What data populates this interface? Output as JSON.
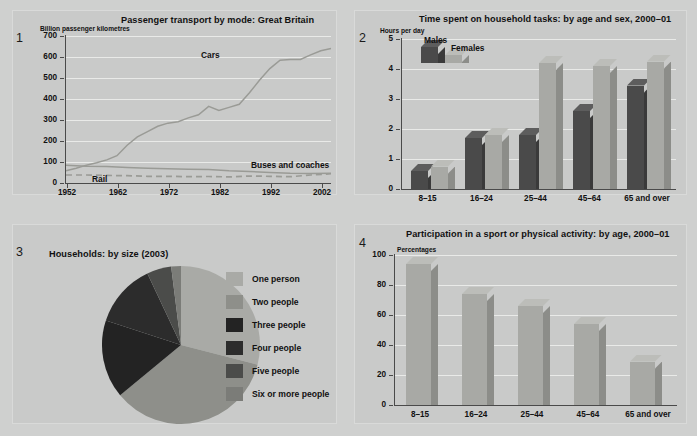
{
  "page": {
    "background": "#cfd0cf",
    "panel_bg": "#c9cac9"
  },
  "colors": {
    "dark_bar": "#4a4a4a",
    "dark_bar_side": "#3a3a3a",
    "light_bar": "#a8a9a5",
    "light_bar_side": "#8c8d89",
    "line_color": "#9a9b96",
    "grid": "#e9eae8",
    "axis": "#4a4a4a",
    "pie_one_person": "#a9aaa6",
    "pie_two_people": "#8e8f8a",
    "pie_three_people": "#232323",
    "pie_four_people": "#2c2c2c",
    "pie_five_people": "#4b4c4a",
    "pie_six_or_more": "#7b7c78"
  },
  "panels": [
    {
      "number": "1",
      "title": "Passenger transport by mode: Great Britain",
      "chart_data": {
        "type": "line",
        "title": "Passenger transport by mode: Great Britain",
        "ylabel": "Billion passenger kilometres",
        "xlabel": "",
        "ylim": [
          0,
          700
        ],
        "yticks": [
          0,
          100,
          200,
          300,
          400,
          500,
          600,
          700
        ],
        "xlim": [
          1952,
          2004
        ],
        "xticks": [
          1952,
          1962,
          1972,
          1982,
          1992,
          2002
        ],
        "grid": true,
        "legend_position": "inline-annotation",
        "annotations": [
          "Cars",
          "Buses and coaches",
          "Rail"
        ],
        "series": [
          {
            "name": "Cars",
            "style": "solid",
            "x": [
              1952,
              1954,
              1956,
              1958,
              1960,
              1962,
              1964,
              1966,
              1968,
              1970,
              1972,
              1974,
              1976,
              1978,
              1980,
              1982,
              1984,
              1986,
              1988,
              1990,
              1992,
              1994,
              1996,
              1998,
              2000,
              2002,
              2004
            ],
            "values": [
              58,
              70,
              85,
              96,
              110,
              130,
              180,
              220,
              245,
              270,
              285,
              292,
              310,
              325,
              365,
              345,
              360,
              375,
              430,
              490,
              545,
              585,
              588,
              588,
              610,
              630,
              640
            ]
          },
          {
            "name": "Buses and coaches",
            "style": "solid",
            "x": [
              1952,
              1956,
              1960,
              1964,
              1968,
              1972,
              1976,
              1980,
              1984,
              1988,
              1992,
              1996,
              2000,
              2004
            ],
            "values": [
              84,
              80,
              79,
              74,
              70,
              68,
              66,
              64,
              58,
              55,
              50,
              46,
              45,
              46
            ]
          },
          {
            "name": "Rail",
            "style": "dashed",
            "x": [
              1952,
              1956,
              1960,
              1964,
              1968,
              1972,
              1976,
              1980,
              1984,
              1988,
              1992,
              1996,
              2000,
              2004
            ],
            "values": [
              38,
              38,
              36,
              35,
              32,
              32,
              30,
              31,
              29,
              33,
              32,
              30,
              38,
              44
            ]
          }
        ]
      }
    },
    {
      "number": "2",
      "title": "Time spent on household tasks: by age and sex, 2000–01",
      "chart_data": {
        "type": "bar",
        "title": "Time spent on household tasks: by age and sex, 2000–01",
        "ylabel": "Hours per day",
        "xlabel": "",
        "ylim": [
          0,
          5
        ],
        "yticks": [
          0,
          1,
          2,
          3,
          4,
          5
        ],
        "grid": true,
        "legend_position": "top-left",
        "categories": [
          "8–15",
          "16–24",
          "25–44",
          "45–64",
          "65 and over"
        ],
        "series": [
          {
            "name": "Males",
            "values": [
              0.6,
              1.7,
              1.8,
              2.6,
              3.45
            ]
          },
          {
            "name": "Females",
            "values": [
              0.75,
              1.8,
              4.2,
              4.1,
              4.25
            ]
          }
        ]
      }
    },
    {
      "number": "3",
      "title": "Households: by size (2003)",
      "chart_data": {
        "type": "pie",
        "title": "Households: by size (2003)",
        "labels": [
          "One person",
          "Two people",
          "Three people",
          "Four people",
          "Five people",
          "Six or more people"
        ],
        "values": [
          29,
          35,
          16,
          13,
          5,
          2
        ],
        "legend_position": "right",
        "grid": false
      }
    },
    {
      "number": "4",
      "title": "Participation in a sport or physical activity: by age, 2000–01",
      "chart_data": {
        "type": "bar",
        "title": "Participation in a sport or physical activity: by age, 2000–01",
        "ylabel": "Percentages",
        "xlabel": "",
        "ylim": [
          0,
          100
        ],
        "yticks": [
          0,
          20,
          40,
          60,
          80,
          100
        ],
        "grid": true,
        "categories": [
          "8–15",
          "16–24",
          "25–44",
          "45–64",
          "65 and over"
        ],
        "series": [
          {
            "name": "Percentages",
            "values": [
              94,
              74,
              66,
              54,
              29
            ]
          }
        ]
      }
    }
  ]
}
